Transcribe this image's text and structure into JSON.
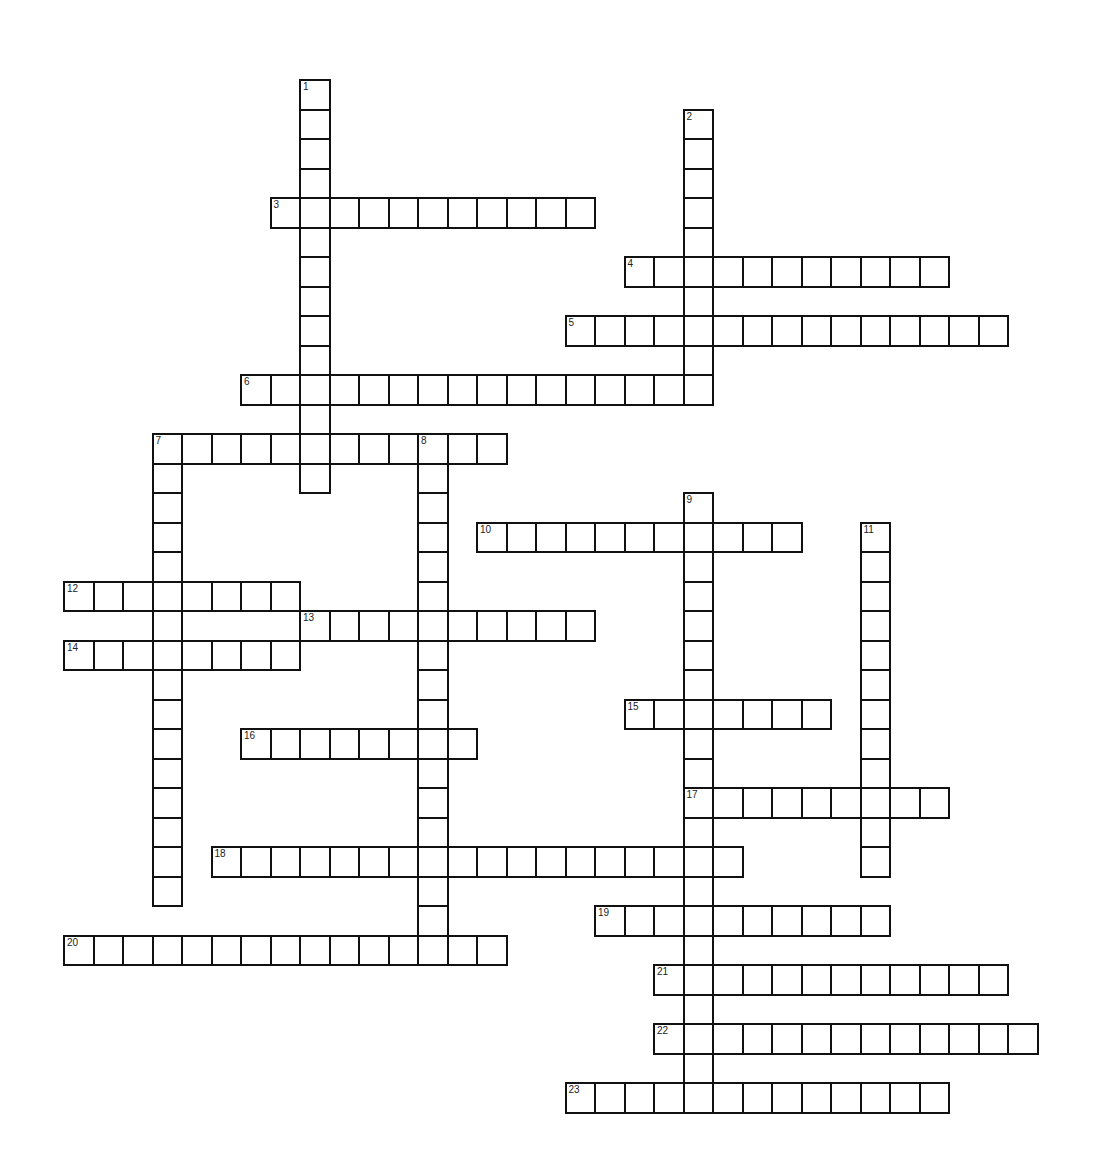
{
  "puzzle": {
    "type": "crossword",
    "cell_size": 29.5,
    "origin": {
      "x": 64,
      "y": 80
    },
    "colors": {
      "line": "#111111",
      "background": "#ffffff",
      "number": "#222222"
    },
    "words": [
      {
        "number": 1,
        "direction": "down",
        "col": 8,
        "row": 0,
        "length": 14
      },
      {
        "number": 2,
        "direction": "down",
        "col": 21,
        "row": 1,
        "length": 10
      },
      {
        "number": 3,
        "direction": "across",
        "col": 7,
        "row": 4,
        "length": 11
      },
      {
        "number": 4,
        "direction": "across",
        "col": 19,
        "row": 6,
        "length": 11
      },
      {
        "number": 5,
        "direction": "across",
        "col": 17,
        "row": 8,
        "length": 15
      },
      {
        "number": 6,
        "direction": "across",
        "col": 6,
        "row": 10,
        "length": 16
      },
      {
        "number": 7,
        "direction": "across",
        "col": 3,
        "row": 12,
        "length": 12
      },
      {
        "number": 7,
        "direction": "down",
        "col": 3,
        "row": 12,
        "length": 16
      },
      {
        "number": 8,
        "direction": "down",
        "col": 12,
        "row": 12,
        "length": 18
      },
      {
        "number": 9,
        "direction": "down",
        "col": 21,
        "row": 14,
        "length": 21
      },
      {
        "number": 10,
        "direction": "across",
        "col": 14,
        "row": 15,
        "length": 11
      },
      {
        "number": 11,
        "direction": "down",
        "col": 27,
        "row": 15,
        "length": 12
      },
      {
        "number": 12,
        "direction": "across",
        "col": 0,
        "row": 17,
        "length": 8
      },
      {
        "number": 13,
        "direction": "across",
        "col": 8,
        "row": 18,
        "length": 10
      },
      {
        "number": 14,
        "direction": "across",
        "col": 0,
        "row": 19,
        "length": 8
      },
      {
        "number": 15,
        "direction": "across",
        "col": 19,
        "row": 21,
        "length": 7
      },
      {
        "number": 16,
        "direction": "across",
        "col": 6,
        "row": 22,
        "length": 8
      },
      {
        "number": 17,
        "direction": "across",
        "col": 21,
        "row": 24,
        "length": 9
      },
      {
        "number": 18,
        "direction": "across",
        "col": 5,
        "row": 26,
        "length": 18
      },
      {
        "number": 19,
        "direction": "across",
        "col": 18,
        "row": 28,
        "length": 10
      },
      {
        "number": 20,
        "direction": "across",
        "col": 0,
        "row": 29,
        "length": 15
      },
      {
        "number": 21,
        "direction": "across",
        "col": 20,
        "row": 30,
        "length": 12
      },
      {
        "number": 22,
        "direction": "across",
        "col": 20,
        "row": 32,
        "length": 13
      },
      {
        "number": 23,
        "direction": "across",
        "col": 17,
        "row": 34,
        "length": 13
      }
    ]
  }
}
